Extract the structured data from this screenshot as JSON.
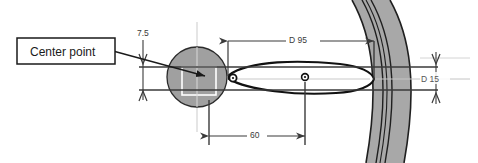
{
  "drawing": {
    "title": "Center point dimensioned assembly section",
    "background_color": "#ffffff",
    "callout": {
      "label": "Center point",
      "box_stroke": "#1a1a1a",
      "box_fill": "#ffffff",
      "leader_name": "leader-line-to-center-point"
    },
    "dimensions": [
      {
        "id": "dim-7-5",
        "label": "7.5",
        "orientation": "vertical",
        "position": "left-of-circle",
        "arrow_style": "outward"
      },
      {
        "id": "dim-d-95",
        "label": "D 95",
        "orientation": "horizontal",
        "position": "top",
        "arrow_style": "inward"
      },
      {
        "id": "dim-d-15",
        "label": "D 15",
        "orientation": "vertical",
        "position": "right",
        "arrow_style": "outward"
      },
      {
        "id": "dim-60",
        "label": "60",
        "orientation": "horizontal",
        "position": "bottom",
        "arrow_style": "inward"
      }
    ],
    "geometry": {
      "circle": {
        "name": "center-point-circle",
        "fill": "#a0a0a0",
        "stroke": "#2b2b2b",
        "cx": 197,
        "cy": 77,
        "r": 30
      },
      "inner_square": {
        "name": "center-point-square-overlay",
        "stroke": "#ffffff"
      },
      "lens": {
        "name": "lens-profile",
        "stroke": "#111111",
        "fill": "#ffffff"
      },
      "band": {
        "name": "curved-wall-band",
        "fill": "#a8a8a8",
        "stroke": "#1f1f1f",
        "line_count": 5
      },
      "markers": [
        {
          "name": "lens-left-tip-marker"
        },
        {
          "name": "lens-center-marker"
        }
      ],
      "centerlines": {
        "name": "centerline-set",
        "stroke": "#cccccc"
      }
    },
    "line_colors": {
      "dimension_line": "#3a3a3a",
      "extension_line": "#3a3a3a",
      "object_line": "#111111",
      "faint_line": "#b9b9b9"
    }
  }
}
